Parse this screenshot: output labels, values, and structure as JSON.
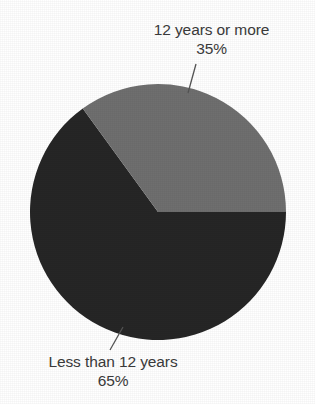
{
  "chart_data": {
    "type": "pie",
    "title": "",
    "subtitle": "",
    "xlabel": "",
    "ylabel": "",
    "legend_position": "none",
    "grid": false,
    "categories": [
      "12 years or more",
      "Less than 12 years"
    ],
    "values": [
      35,
      65
    ],
    "value_unit": "%",
    "slices": [
      {
        "label": "12 years or more",
        "value": 35,
        "value_label": "35%",
        "color": "#6f6f6f",
        "start_angle_deg": 0,
        "end_angle_deg": 126
      },
      {
        "label": "Less than 12 years",
        "value": 65,
        "value_label": "65%",
        "color": "#262626",
        "start_angle_deg": 126,
        "end_angle_deg": 360
      }
    ]
  },
  "chart": {
    "background_color": "#ffffff",
    "text_color": "#3b3b3b",
    "leader_line_color": "#555555",
    "center_x": 158,
    "center_y": 212,
    "radius": 128
  },
  "labels": {
    "top": {
      "name": "12 years or more",
      "percent": "35%"
    },
    "bottom": {
      "name": "Less than 12 years",
      "percent": "65%"
    }
  }
}
